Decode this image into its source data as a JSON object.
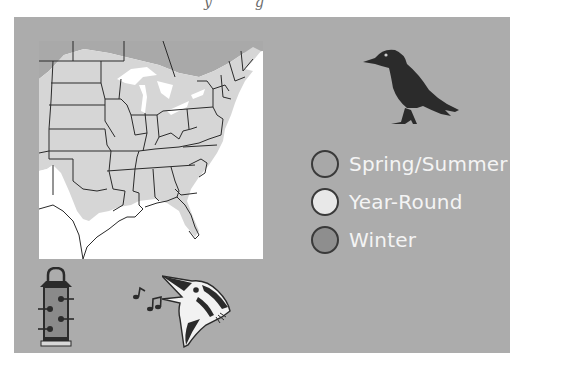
{
  "header": {
    "cropped_text_fragments": [
      "y",
      "g"
    ]
  },
  "map": {
    "region": "Eastern United States",
    "shading": {
      "canada_north": "#a9a9a9",
      "year_round_range": "#d6d6d6",
      "outside_range": "#ffffff",
      "state_lines": "#2a2a2a"
    }
  },
  "legend": {
    "items": [
      {
        "label": "Spring/Summer",
        "color": "#a8a8a8"
      },
      {
        "label": "Year-Round",
        "color": "#e8e8e8"
      },
      {
        "label": "Winter",
        "color": "#8e8e8e"
      }
    ]
  },
  "icons": {
    "bird": "crow-silhouette-icon",
    "feeder": "tube-feeder-icon",
    "song": "music-notes-icon",
    "singing_bird": "singing-bird-head-icon"
  },
  "colors": {
    "panel_bg": "#acacac",
    "legend_text": "#f4f4f4",
    "icon_dark": "#2b2b2b"
  }
}
